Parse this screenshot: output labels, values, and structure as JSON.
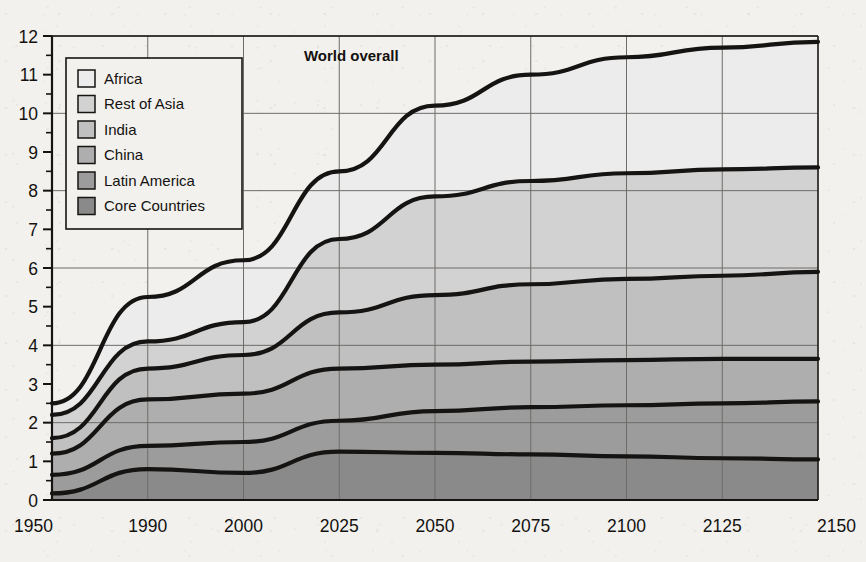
{
  "chart_data": {
    "type": "area",
    "title": "",
    "subtitle": "",
    "xlabel": "",
    "ylabel": "",
    "stacked": true,
    "grid": true,
    "legend_position": "top-left-inside",
    "x": [
      "1950",
      "1990",
      "2000",
      "2025",
      "2050",
      "2075",
      "2100",
      "2125",
      "2150"
    ],
    "xtick_labels": [
      "1950",
      "1990",
      "2000",
      "2025",
      "2050",
      "2075",
      "2100",
      "2125",
      "2150"
    ],
    "xlim_note": "categorical, evenly spaced",
    "ylim": [
      0,
      12
    ],
    "ytick_labels": [
      "0",
      "1",
      "2",
      "3",
      "4",
      "5",
      "6",
      "7",
      "8",
      "9",
      "10",
      "11",
      "12"
    ],
    "ytick_values": [
      0,
      1,
      2,
      3,
      4,
      5,
      6,
      7,
      8,
      9,
      10,
      11,
      12
    ],
    "yminor_step": 0.5,
    "gridline_y_values": [
      0,
      2,
      4,
      6,
      8,
      10,
      12
    ],
    "series": [
      {
        "name": "Core Countries",
        "color": "#8a8a8a",
        "values": [
          0.17,
          0.8,
          0.7,
          1.25,
          1.22,
          1.18,
          1.13,
          1.08,
          1.05
        ],
        "cumulative": [
          0.17,
          0.8,
          0.7,
          1.25,
          1.22,
          1.18,
          1.13,
          1.08,
          1.05
        ]
      },
      {
        "name": "Latin America",
        "color": "#9c9c9c",
        "values": [
          0.48,
          0.6,
          0.8,
          0.8,
          1.08,
          1.22,
          1.32,
          1.42,
          1.5
        ],
        "cumulative": [
          0.65,
          1.4,
          1.5,
          2.05,
          2.3,
          2.4,
          2.45,
          2.5,
          2.55
        ]
      },
      {
        "name": "China",
        "color": "#aeaeae",
        "values": [
          0.55,
          1.2,
          1.25,
          1.35,
          1.2,
          1.18,
          1.17,
          1.15,
          1.1
        ],
        "cumulative": [
          1.2,
          2.6,
          2.75,
          3.4,
          3.5,
          3.58,
          3.62,
          3.65,
          3.65
        ]
      },
      {
        "name": "India",
        "color": "#c0c0c0",
        "values": [
          0.4,
          0.8,
          1.0,
          1.45,
          1.8,
          2.0,
          2.1,
          2.15,
          2.25
        ],
        "cumulative": [
          1.6,
          3.4,
          3.75,
          4.85,
          5.3,
          5.58,
          5.72,
          5.8,
          5.9
        ]
      },
      {
        "name": "Rest of Asia",
        "color": "#d2d2d2",
        "values": [
          0.6,
          0.7,
          0.85,
          1.9,
          2.55,
          2.67,
          2.73,
          2.75,
          2.7
        ],
        "cumulative": [
          2.2,
          4.1,
          4.6,
          6.75,
          7.85,
          8.25,
          8.45,
          8.55,
          8.6
        ]
      },
      {
        "name": "Africa",
        "color": "#ececec",
        "values": [
          0.3,
          1.15,
          1.6,
          1.75,
          2.35,
          2.75,
          3.0,
          3.15,
          3.25
        ],
        "cumulative": [
          2.5,
          5.25,
          6.2,
          8.5,
          10.2,
          11.0,
          11.45,
          11.7,
          11.85
        ]
      }
    ],
    "annotations": [
      {
        "text": "World overall",
        "x": "2025",
        "y": 11.35,
        "bold": true
      }
    ],
    "world_total": [
      2.5,
      5.25,
      6.2,
      8.5,
      10.2,
      11.0,
      11.45,
      11.7,
      11.85
    ]
  },
  "legend": {
    "items": [
      {
        "label": "Africa",
        "swatch": "#ececec"
      },
      {
        "label": "Rest of Asia",
        "swatch": "#d2d2d2"
      },
      {
        "label": "India",
        "swatch": "#c0c0c0"
      },
      {
        "label": "China",
        "swatch": "#aeaeae"
      },
      {
        "label": "Latin America",
        "swatch": "#9c9c9c"
      },
      {
        "label": "Core Countries",
        "swatch": "#8a8a8a"
      }
    ]
  },
  "style": {
    "line_color": "#161412",
    "grid_color": "#6e6c68",
    "axis_color": "#161412",
    "text_color": "#14110f",
    "background": "#f2f1ee",
    "legend_background": "#f2f1ee"
  }
}
